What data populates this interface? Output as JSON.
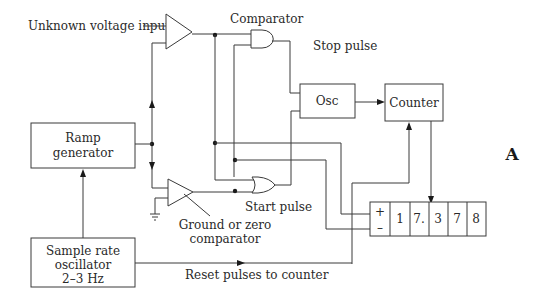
{
  "diagram": {
    "figure_label": "A",
    "labels": {
      "unknown_input": "Unknown voltage input",
      "comparator": "Comparator",
      "stop_pulse": "Stop pulse",
      "start_pulse": "Start pulse",
      "ground_comp_line1": "Ground or zero",
      "ground_comp_line2": "comparator",
      "reset_pulses": "Reset pulses to counter"
    },
    "blocks": {
      "ramp_line1": "Ramp",
      "ramp_line2": "generator",
      "osc": "Osc",
      "counter": "Counter",
      "sample_line1": "Sample rate",
      "sample_line2": "oscillator",
      "sample_line3": "2–3 Hz"
    },
    "display": {
      "sign_plus": "+",
      "sign_minus": "–",
      "digits": [
        "1",
        "7.",
        "3",
        "7",
        "8"
      ]
    },
    "colors": {
      "line": "#3a3a3a",
      "text": "#2a2a2a",
      "background": "#ffffff"
    }
  }
}
